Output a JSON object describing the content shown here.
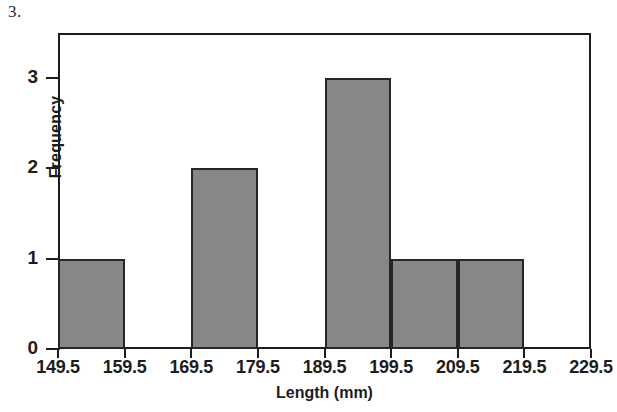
{
  "figure": {
    "question_number": "3.",
    "background_color": "#ffffff",
    "frame_color": "#1d1d1d"
  },
  "chart_data": {
    "type": "bar",
    "title": "",
    "xlabel": "Length (mm)",
    "ylabel": "Frequency",
    "categories": [
      "149.5-159.5",
      "159.5-169.5",
      "169.5-179.5",
      "179.5-189.5",
      "189.5-199.5",
      "199.5-209.5",
      "209.5-219.5",
      "219.5-229.5"
    ],
    "bin_edges": [
      149.5,
      159.5,
      169.5,
      179.5,
      189.5,
      199.5,
      209.5,
      219.5,
      229.5
    ],
    "values": [
      1,
      0,
      2,
      0,
      3,
      1,
      1,
      0
    ],
    "bar_color": "#878787",
    "bar_edge_color": "#262626",
    "bar_width": 10,
    "xlim": [
      149.5,
      229.5
    ],
    "ylim": [
      0,
      3.5
    ],
    "xticks": [
      "149.5",
      "159.5",
      "169.5",
      "179.5",
      "189.5",
      "199.5",
      "209.5",
      "219.5",
      "229.5"
    ],
    "yticks": [
      "0",
      "1",
      "2",
      "3"
    ],
    "ytick_values": [
      0,
      1,
      2,
      3
    ],
    "grid": false,
    "legend": false
  }
}
